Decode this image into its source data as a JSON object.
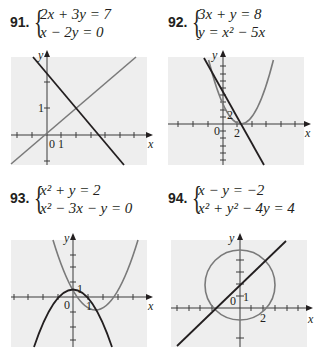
{
  "problems": [
    {
      "number": "91.",
      "equations": [
        "2x + 3y = 7",
        "x − 2y = 0"
      ],
      "graph": {
        "axis_labels": {
          "x": "x",
          "y": "y"
        },
        "tick_labels": [
          "0",
          "1",
          "1"
        ]
      }
    },
    {
      "number": "92.",
      "equations": [
        "3x + y = 8",
        "y = x² − 5x"
      ],
      "graph": {
        "axis_labels": {
          "x": "x",
          "y": "y"
        },
        "tick_labels": [
          "0",
          "2",
          "2"
        ]
      }
    },
    {
      "number": "93.",
      "equations": [
        "x² + y = 2",
        "x² − 3x − y = 0"
      ],
      "graph": {
        "axis_labels": {
          "x": "x",
          "y": "y"
        },
        "tick_labels": [
          "0",
          "1",
          "1"
        ]
      }
    },
    {
      "number": "94.",
      "equations": [
        "x − y = −2",
        "x² + y² − 4y = 4"
      ],
      "graph": {
        "axis_labels": {
          "x": "x",
          "y": "y"
        },
        "tick_labels": [
          "0",
          "1",
          "2"
        ]
      }
    }
  ],
  "colors": {
    "panel": "#eeeeee",
    "dark_curve": "#231f20",
    "gray_curve": "#7a7a7a",
    "axis": "#3a3a3a"
  }
}
